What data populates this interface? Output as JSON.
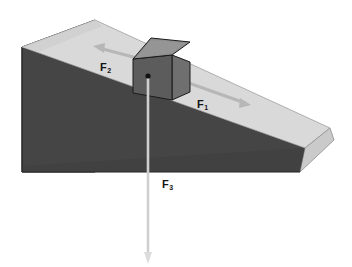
{
  "diagram": {
    "background_color": "#ffffff"
  },
  "ramp": {
    "name": "inclined-plane-wedge",
    "top_surface_color": "#d9d9d9",
    "top_surface_shade_color": "#cfcfcf",
    "side_face_color": "#3f3f3f",
    "front_face_color": "#444444",
    "edge_color": "#1a1a1a",
    "slab_edge_color": "#bdbdbd"
  },
  "block": {
    "name": "block-cube",
    "top_face_color": "#8d8d8d",
    "front_face_color": "#5a5a5a",
    "right_face_color": "#6e6e6e",
    "edge_color": "#1a1a1a",
    "center_dot_color": "#111111"
  },
  "forces": [
    {
      "id": "f1",
      "label": "F",
      "subscript": "1",
      "description": "force directed down the slope",
      "direction": "down-slope-right",
      "color": "#b5b5b5"
    },
    {
      "id": "f2",
      "label": "F",
      "subscript": "2",
      "description": "force directed up the slope",
      "direction": "up-slope-left",
      "color": "#b5b5b5"
    },
    {
      "id": "f3",
      "label": "F",
      "subscript": "3",
      "description": "force directed vertically downward from block center",
      "direction": "vertical-down",
      "color": "#cccccc"
    }
  ]
}
